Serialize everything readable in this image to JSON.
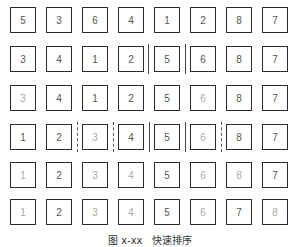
{
  "figure": {
    "caption": "图 x-xx   快速排序",
    "rows": [
      {
        "label": "initial",
        "cells": [
          {
            "value": "5",
            "gray": false
          },
          {
            "value": "3",
            "gray": false
          },
          {
            "value": "6",
            "gray": false
          },
          {
            "value": "4",
            "gray": false
          },
          {
            "value": "1",
            "gray": false
          },
          {
            "value": "2",
            "gray": false
          },
          {
            "value": "8",
            "gray": false
          },
          {
            "value": "7",
            "gray": false
          }
        ],
        "separators": [
          {
            "after_index": null,
            "style": "none"
          }
        ]
      },
      {
        "label": "pass-1",
        "cells": [
          {
            "value": "3",
            "gray": false
          },
          {
            "value": "4",
            "gray": false
          },
          {
            "value": "1",
            "gray": false
          },
          {
            "value": "2",
            "gray": false
          },
          {
            "value": "5",
            "gray": false
          },
          {
            "value": "6",
            "gray": false
          },
          {
            "value": "8",
            "gray": false
          },
          {
            "value": "7",
            "gray": false
          }
        ],
        "separators": [
          {
            "after_index": 3,
            "style": "solid"
          },
          {
            "after_index": 4,
            "style": "solid"
          }
        ]
      },
      {
        "label": "pass-2",
        "cells": [
          {
            "value": "3",
            "gray": true
          },
          {
            "value": "4",
            "gray": false
          },
          {
            "value": "1",
            "gray": false
          },
          {
            "value": "2",
            "gray": false
          },
          {
            "value": "5",
            "gray": false
          },
          {
            "value": "6",
            "gray": true
          },
          {
            "value": "8",
            "gray": false
          },
          {
            "value": "7",
            "gray": false
          }
        ],
        "separators": []
      },
      {
        "label": "pass-3",
        "cells": [
          {
            "value": "1",
            "gray": false
          },
          {
            "value": "2",
            "gray": false
          },
          {
            "value": "3",
            "gray": true
          },
          {
            "value": "4",
            "gray": false
          },
          {
            "value": "5",
            "gray": false
          },
          {
            "value": "6",
            "gray": true
          },
          {
            "value": "8",
            "gray": false
          },
          {
            "value": "7",
            "gray": false
          }
        ],
        "separators": [
          {
            "after_index": 1,
            "style": "dashed"
          },
          {
            "after_index": 2,
            "style": "dashed"
          },
          {
            "after_index": 3,
            "style": "solid"
          },
          {
            "after_index": 4,
            "style": "solid"
          },
          {
            "after_index": 5,
            "style": "dashed"
          }
        ]
      },
      {
        "label": "pass-4",
        "cells": [
          {
            "value": "1",
            "gray": true
          },
          {
            "value": "2",
            "gray": false
          },
          {
            "value": "3",
            "gray": true
          },
          {
            "value": "4",
            "gray": true
          },
          {
            "value": "5",
            "gray": false
          },
          {
            "value": "6",
            "gray": true
          },
          {
            "value": "8",
            "gray": true
          },
          {
            "value": "7",
            "gray": false
          }
        ],
        "separators": []
      },
      {
        "label": "sorted",
        "cells": [
          {
            "value": "1",
            "gray": true
          },
          {
            "value": "2",
            "gray": false
          },
          {
            "value": "3",
            "gray": true
          },
          {
            "value": "4",
            "gray": true
          },
          {
            "value": "5",
            "gray": false
          },
          {
            "value": "6",
            "gray": true
          },
          {
            "value": "7",
            "gray": false
          },
          {
            "value": "8",
            "gray": true
          }
        ],
        "separators": []
      }
    ]
  }
}
